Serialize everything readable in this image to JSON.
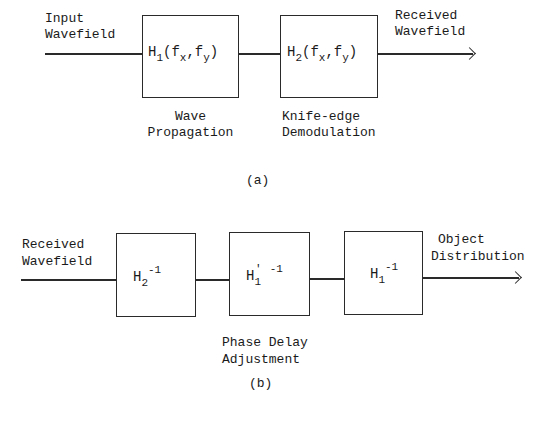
{
  "diagram_a": {
    "caption": "(a)",
    "input_label": [
      "Input",
      "Wavefield"
    ],
    "output_label": [
      "Received",
      "Wavefield"
    ],
    "blocks": [
      {
        "base": "H",
        "sub": "1",
        "args_open": "(f",
        "x_sub": "x",
        "comma": ",f",
        "y_sub": "y",
        "close": ")",
        "desc": [
          "Wave",
          "Propagation"
        ]
      },
      {
        "base": "H",
        "sub": "2",
        "args_open": "(f",
        "x_sub": "x",
        "comma": ",f",
        "y_sub": "y",
        "close": ")",
        "desc": [
          "Knife-edge",
          "Demodulation"
        ]
      }
    ]
  },
  "diagram_b": {
    "caption": "(b)",
    "input_label": [
      "Received",
      "Wavefield"
    ],
    "output_label": [
      "Object",
      "Distribution"
    ],
    "blocks": [
      {
        "base": "H",
        "sub": "2",
        "prime": "",
        "sup": "-1"
      },
      {
        "base": "H",
        "sub": "1",
        "prime": "'",
        "sup": "-1"
      },
      {
        "base": "H",
        "sub": "1",
        "prime": "",
        "sup": "-1"
      }
    ],
    "middle_desc": [
      "Phase Delay",
      "Adjustment"
    ]
  },
  "colors": {
    "line": "#2a2a2a",
    "text": "#1a1a1a",
    "background": "#ffffff"
  }
}
